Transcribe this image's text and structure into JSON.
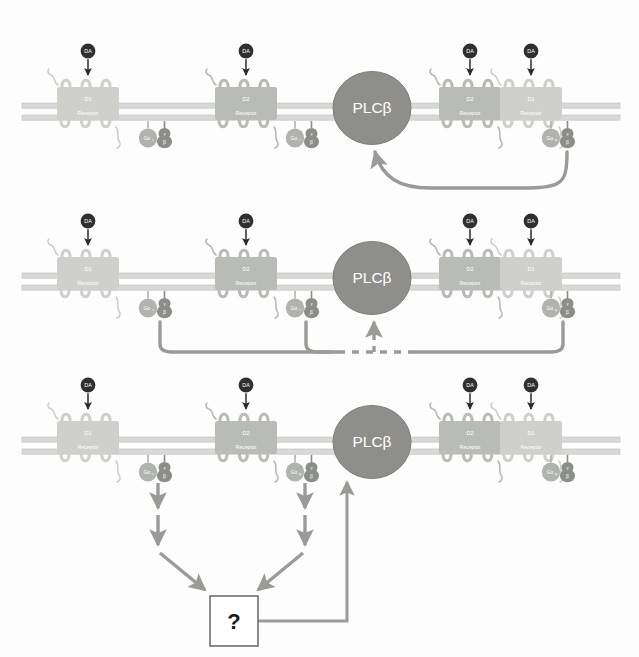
{
  "figure": {
    "background_color": "#fdfdfd",
    "width": 639,
    "height": 657
  },
  "palette": {
    "membrane": "#d8d9d7",
    "membrane_edge": "#c4c6c3",
    "receptor_light": "#cfd0cc",
    "receptor_mid": "#b9bbb6",
    "receptor_dark": "#a9aba6",
    "plcb_fill": "#8e8f8a",
    "plcb_stroke": "#7c7d78",
    "galpha_fill": "#b0b2ad",
    "gbeta_fill": "#8b8d88",
    "ggamma_fill": "#8b8d88",
    "da_fill": "#2f2f2f",
    "da_text": "#ffffff",
    "arrow_gray": "#9a9b96",
    "arrow_dark": "#8a8b86",
    "box_stroke": "#6f706b",
    "label_text": "#ffffff",
    "qmark_text": "#1a1a1a",
    "line_black": "#2b2b2b"
  },
  "panels": [
    {
      "id": "panel-top",
      "index": 1,
      "receptors": [
        {
          "name": "D1 Receptor",
          "line1": "D1",
          "line2": "Receptor",
          "shade": "light",
          "ligand": "DA"
        },
        {
          "name": "D2 Receptor",
          "line1": "D2",
          "line2": "Receptor",
          "shade": "mid",
          "ligand": "DA"
        },
        {
          "name": "D2 Receptor",
          "line1": "D2",
          "line2": "Receptor",
          "shade": "mid",
          "ligand": "DA"
        },
        {
          "name": "D1 Receptor",
          "line1": "D1",
          "line2": "Receptor",
          "shade": "light",
          "ligand": "DA"
        }
      ],
      "gproteins": [
        {
          "alpha": "Gα",
          "alpha_sub": "s",
          "beta": "β",
          "gamma": "γ"
        },
        {
          "alpha": "Gα",
          "alpha_sub": "i",
          "beta": "β",
          "gamma": "γ"
        },
        {
          "alpha": "Gα",
          "alpha_sub": "q",
          "beta": "β",
          "gamma": "γ"
        }
      ],
      "effector": {
        "label": "PLCβ"
      },
      "arrows": [
        {
          "kind": "curved-solid",
          "from": "heteromer-gq",
          "to": "plcb",
          "style": "solid"
        }
      ]
    },
    {
      "id": "panel-middle",
      "index": 2,
      "receptors": [
        {
          "name": "D1 Receptor",
          "line1": "D1",
          "line2": "Receptor",
          "shade": "light",
          "ligand": "DA"
        },
        {
          "name": "D2 Receptor",
          "line1": "D2",
          "line2": "Receptor",
          "shade": "mid",
          "ligand": "DA"
        },
        {
          "name": "D2 Receptor",
          "line1": "D2",
          "line2": "Receptor",
          "shade": "mid",
          "ligand": "DA"
        },
        {
          "name": "D1 Receptor",
          "line1": "D1",
          "line2": "Receptor",
          "shade": "light",
          "ligand": "DA"
        }
      ],
      "gproteins": [
        {
          "alpha": "Gα",
          "alpha_sub": "s",
          "beta": "β",
          "gamma": "γ"
        },
        {
          "alpha": "Gα",
          "alpha_sub": "i",
          "beta": "β",
          "gamma": "γ"
        },
        {
          "alpha": "Gα",
          "alpha_sub": "q",
          "beta": "β",
          "gamma": "γ"
        }
      ],
      "effector": {
        "label": "PLCβ"
      },
      "arrows": [
        {
          "kind": "elbow-solid",
          "from": "g-left",
          "to": "junction",
          "style": "solid"
        },
        {
          "kind": "elbow-solid",
          "from": "g-middle",
          "to": "junction",
          "style": "solid"
        },
        {
          "kind": "elbow-solid",
          "from": "g-right",
          "to": "junction",
          "style": "solid"
        },
        {
          "kind": "vertical-dashed",
          "from": "junction",
          "to": "plcb",
          "style": "dashed"
        }
      ]
    },
    {
      "id": "panel-bottom",
      "index": 3,
      "receptors": [
        {
          "name": "D1 Receptor",
          "line1": "D1",
          "line2": "Receptor",
          "shade": "light",
          "ligand": "DA"
        },
        {
          "name": "D2 Receptor",
          "line1": "D2",
          "line2": "Receptor",
          "shade": "mid",
          "ligand": "DA"
        },
        {
          "name": "D2 Receptor",
          "line1": "D2",
          "line2": "Receptor",
          "shade": "mid",
          "ligand": "DA"
        },
        {
          "name": "D1 Receptor",
          "line1": "D1",
          "line2": "Receptor",
          "shade": "light",
          "ligand": "DA"
        }
      ],
      "gproteins": [
        {
          "alpha": "Gα",
          "alpha_sub": "s",
          "beta": "β",
          "gamma": "γ"
        },
        {
          "alpha": "Gα",
          "alpha_sub": "q",
          "beta": "β",
          "gamma": "γ"
        },
        {
          "alpha": "Gα",
          "alpha_sub": "q",
          "beta": "β",
          "gamma": "γ"
        }
      ],
      "effector": {
        "label": "PLCβ"
      },
      "unknown_node": {
        "label": "?"
      },
      "arrows": [
        {
          "kind": "vertical-solid",
          "from": "g-left",
          "to": "unknown",
          "style": "solid"
        },
        {
          "kind": "vertical-solid",
          "from": "g-middle",
          "to": "unknown",
          "style": "solid"
        },
        {
          "kind": "diagonal-solid",
          "from": "g-left",
          "to": "unknown",
          "style": "solid"
        },
        {
          "kind": "diagonal-solid",
          "from": "g-middle",
          "to": "unknown",
          "style": "solid"
        },
        {
          "kind": "elbow-up",
          "from": "unknown",
          "to": "plcb",
          "style": "solid"
        }
      ]
    }
  ],
  "legend_terms": {
    "dopamine": "DA",
    "effector": "PLCβ",
    "unknown": "?"
  }
}
